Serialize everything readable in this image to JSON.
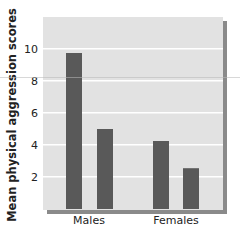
{
  "chart_data": {
    "type": "bar",
    "title": "",
    "xlabel": "",
    "ylabel": "Mean physical aggression scores",
    "categories": [
      "Males",
      "Females"
    ],
    "series": [
      {
        "name": "Bar 1",
        "values": [
          9.75,
          4.25
        ]
      },
      {
        "name": "Bar 2",
        "values": [
          5.0,
          2.55
        ]
      }
    ],
    "ylim": [
      0,
      11.5
    ],
    "yticks": [
      2,
      4,
      6,
      8,
      10
    ],
    "grid": true,
    "legend": null
  },
  "colors": {
    "panel": "#e2e2e2",
    "panel_shadow": "#8a8a8a",
    "bar": "#595959",
    "gridline": "#ffffff",
    "text": "#222222"
  }
}
